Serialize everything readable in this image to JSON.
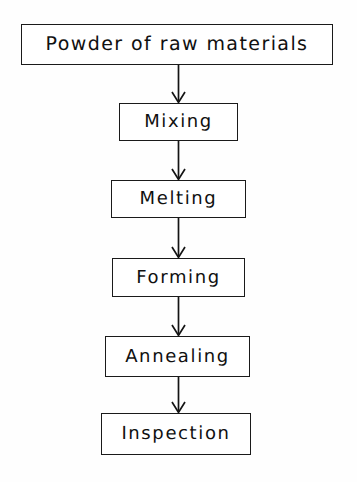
{
  "diagram": {
    "type": "flowchart",
    "orientation": "vertical",
    "background_color": "#fefefe",
    "line_color": "#141414",
    "text_color": "#101010",
    "nodes": [
      {
        "id": "powder",
        "label": "Powder of raw materials"
      },
      {
        "id": "mixing",
        "label": "Mixing"
      },
      {
        "id": "melting",
        "label": "Melting"
      },
      {
        "id": "forming",
        "label": "Forming"
      },
      {
        "id": "annealing",
        "label": "Annealing"
      },
      {
        "id": "inspection",
        "label": "Inspection"
      }
    ],
    "edges": [
      {
        "from": "powder",
        "to": "mixing",
        "style": "arrow-down"
      },
      {
        "from": "mixing",
        "to": "melting",
        "style": "arrow-down"
      },
      {
        "from": "melting",
        "to": "forming",
        "style": "arrow-down"
      },
      {
        "from": "forming",
        "to": "annealing",
        "style": "arrow-down"
      },
      {
        "from": "annealing",
        "to": "inspection",
        "style": "arrow-down"
      }
    ]
  }
}
